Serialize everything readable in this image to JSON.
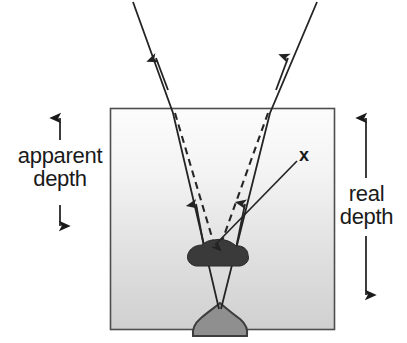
{
  "figure": {
    "type": "optics-ray-diagram",
    "width": 407,
    "height": 343
  },
  "labels": {
    "apparent_depth_line1": "apparent",
    "apparent_depth_line2": "depth",
    "real_depth_line1": "real",
    "real_depth_line2": "depth",
    "object_marker": "x"
  },
  "colors": {
    "ink": "#1a1a1a",
    "ray": "#262626",
    "box_border": "#4d4d4d",
    "water_top": "#fbfbfb",
    "water_bottom": "#d2d2d2",
    "apparent_object_fill": "#3a3a3a",
    "real_object_fill": "#8c8c8c",
    "real_object_stroke": "#3a3a3a",
    "page_background": "#ffffff"
  },
  "geometry": {
    "medium_box": {
      "x": 110,
      "y": 108,
      "width": 225,
      "height": 222
    },
    "apparent_depth_arrow": {
      "x": 60,
      "y_top": 112,
      "y_bottom": 231
    },
    "real_depth_arrow": {
      "x": 366,
      "y_top": 112,
      "y_bottom": 301
    },
    "left_ray": {
      "from_x": 133,
      "from_y": 2,
      "surface_x": 173,
      "to_x": 218,
      "to_y": 312
    },
    "right_ray": {
      "from_x": 317,
      "from_y": 2,
      "surface_x": 270,
      "to_x": 222,
      "to_y": 312
    },
    "left_dashed": {
      "surface_x": 173,
      "to_x": 215,
      "to_y": 242
    },
    "right_dashed": {
      "surface_x": 270,
      "to_x": 222,
      "to_y": 242
    },
    "pointer_line": {
      "from_x": 297,
      "from_y": 160,
      "to_x": 214,
      "to_y": 246
    },
    "apparent_object": {
      "cx": 218,
      "cy": 252,
      "rx": 29,
      "ry": 15
    },
    "real_object": {
      "cx": 220,
      "cy": 322,
      "rx": 26,
      "ry": 16
    }
  },
  "annotations": {
    "description": "Two solid refracted light rays leave the surface of a denser medium and travel upward; dashed backward extensions of the rays meet at a shallower point, showing the apparent (virtual) image above the real object at the bottom."
  }
}
